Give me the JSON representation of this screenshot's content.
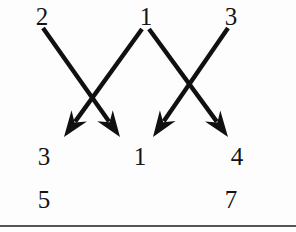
{
  "diagram": {
    "ink_color": "#101010",
    "background_color": "#fdfdfd",
    "top_row": {
      "name": "domain-row",
      "labels": [
        {
          "text": "2",
          "x": 42,
          "y": 16
        },
        {
          "text": "1",
          "x": 146,
          "y": 16
        },
        {
          "text": "3",
          "x": 231,
          "y": 16
        }
      ]
    },
    "middle_row": {
      "name": "codomain-row",
      "labels": [
        {
          "text": "3",
          "x": 44,
          "y": 156
        },
        {
          "text": "1",
          "x": 140,
          "y": 156
        },
        {
          "text": "4",
          "x": 237,
          "y": 156
        }
      ]
    },
    "bottom_row": {
      "name": "result-row",
      "labels": [
        {
          "text": "5",
          "x": 44,
          "y": 199
        },
        {
          "text": "7",
          "x": 231,
          "y": 199
        }
      ]
    },
    "arrows": [
      {
        "name": "arrow-2-to-1",
        "from_label": "2",
        "to_label": "1",
        "x1": 43,
        "y1": 28,
        "x2": 120,
        "y2": 137
      },
      {
        "name": "arrow-1-to-3",
        "from_label": "1",
        "to_label": "3",
        "x1": 142,
        "y1": 29,
        "x2": 64,
        "y2": 137
      },
      {
        "name": "arrow-1-to-4",
        "from_label": "1",
        "to_label": "4",
        "x1": 149,
        "y1": 29,
        "x2": 228,
        "y2": 137
      },
      {
        "name": "arrow-3-to-1",
        "from_label": "3",
        "to_label": "1",
        "x1": 228,
        "y1": 28,
        "x2": 153,
        "y2": 137
      }
    ],
    "horizontal_rule": {
      "name": "page-divider",
      "y": 225,
      "width": 296
    }
  }
}
